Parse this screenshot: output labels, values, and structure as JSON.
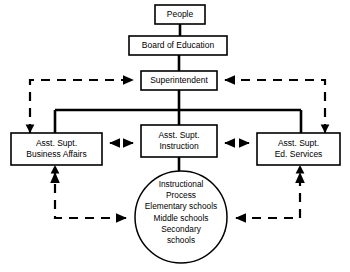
{
  "diagram": {
    "type": "organizational-flow-chart",
    "background_color": "#ffffff",
    "line_color": "#000000",
    "nodes": {
      "people": {
        "label": "People",
        "shape": "rectangle",
        "x": 155,
        "y": 5,
        "w": 50,
        "h": 19
      },
      "board": {
        "label": "Board of Education",
        "shape": "rectangle",
        "x": 129,
        "y": 36,
        "w": 98,
        "h": 19
      },
      "superintendent": {
        "label": "Superintendent",
        "shape": "rectangle",
        "x": 141,
        "y": 71,
        "w": 76,
        "h": 19
      },
      "business_affairs": {
        "line1": "Asst. Supt.",
        "line2": "Business Affairs",
        "shape": "rectangle",
        "x": 11,
        "y": 133,
        "w": 91,
        "h": 32
      },
      "instruction": {
        "line1": "Asst. Supt.",
        "line2": "Instruction",
        "shape": "rectangle",
        "x": 141,
        "y": 125,
        "w": 76,
        "h": 32
      },
      "ed_services": {
        "line1": "Asst. Supt.",
        "line2": "Ed. Services",
        "shape": "rectangle",
        "x": 257,
        "y": 133,
        "w": 83,
        "h": 32
      },
      "instructional_process": {
        "shape": "circle",
        "cx": 181,
        "cy": 217,
        "r": 47,
        "lines": [
          "Instructional",
          "Process",
          "Elementary schools",
          "Middle schools",
          "Secondary",
          "schools"
        ]
      }
    },
    "edges": [
      {
        "from": "people",
        "to": "board",
        "style": "solid",
        "arrow": "none"
      },
      {
        "from": "board",
        "to": "superintendent",
        "style": "solid",
        "arrow": "none"
      },
      {
        "from": "superintendent",
        "to": "instruction",
        "style": "solid",
        "arrow": "none"
      },
      {
        "from": "superintendent",
        "to": "business_affairs",
        "style": "solid",
        "arrow": "none"
      },
      {
        "from": "superintendent",
        "to": "ed_services",
        "style": "solid",
        "arrow": "none"
      },
      {
        "from": "instruction",
        "to": "instructional_process",
        "style": "solid",
        "arrow": "none"
      },
      {
        "from": "business_affairs",
        "to": "superintendent",
        "style": "dashed",
        "arrow": "single"
      },
      {
        "from": "ed_services",
        "to": "superintendent",
        "style": "dashed",
        "arrow": "single"
      },
      {
        "from": "business_affairs",
        "to": "instruction",
        "style": "dashed",
        "arrow": "double"
      },
      {
        "from": "instruction",
        "to": "ed_services",
        "style": "dashed",
        "arrow": "double"
      },
      {
        "from": "instructional_process",
        "to": "business_affairs",
        "style": "dashed",
        "arrow": "double"
      },
      {
        "from": "instructional_process",
        "to": "ed_services",
        "style": "dashed",
        "arrow": "double"
      }
    ]
  }
}
